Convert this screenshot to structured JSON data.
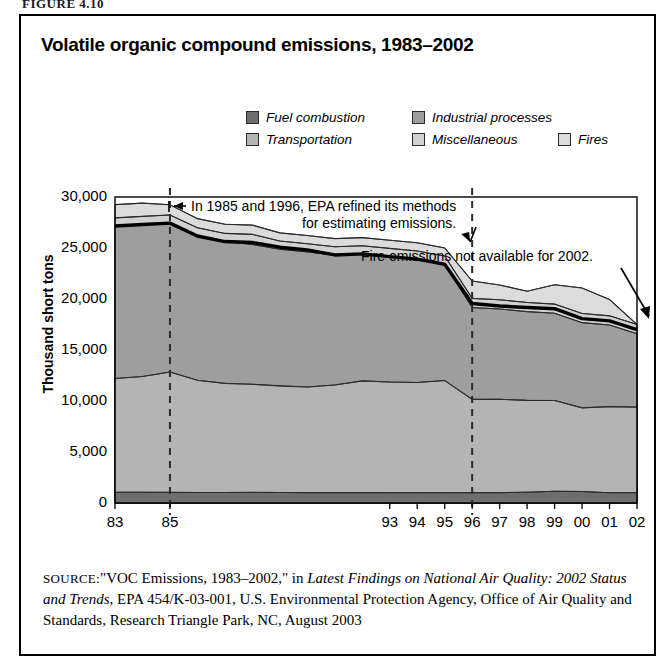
{
  "figure_caption": "FIGURE 4.10",
  "chart_title": "Volatile organic compound emissions, 1983–2002",
  "legend": {
    "items": [
      {
        "label": "Fuel combustion",
        "color": "#6e6e6e",
        "key": "fuel_combustion"
      },
      {
        "label": "Industrial processes",
        "color": "#9e9e9e",
        "key": "industrial_processes"
      },
      {
        "label": "Transportation",
        "color": "#b4b4b4",
        "key": "transportation"
      },
      {
        "label": "Miscellaneous",
        "color": "#d2d2d2",
        "key": "miscellaneous"
      },
      {
        "label": "Fires",
        "color": "#dcdcdc",
        "key": "fires"
      }
    ]
  },
  "annotations": [
    {
      "name": "epa-methods-note",
      "line1": "In 1985 and 1996, EPA refined its methods",
      "line2": "for estimating emissions."
    },
    {
      "name": "fires-2002-note",
      "text": "Fire emissions not available for 2002."
    }
  ],
  "source": {
    "label": "SOURCE:",
    "text_1": "\"VOC Emissions, 1983–2002,\" in ",
    "italic_1": "Latest Findings on National Air Quality: 2002 Status and Trends,",
    "text_2": " EPA 454/K-03-001, U.S. Environmental Protection Agency, Office of Air Quality and Standards, Research Triangle Park, NC, August 2003"
  },
  "chart_data": {
    "type": "area",
    "title": "Volatile organic compound emissions, 1983–2002",
    "xlabel": "",
    "ylabel": "Thousand short tons",
    "ylim": [
      0,
      30000
    ],
    "yticks": [
      0,
      5000,
      10000,
      15000,
      20000,
      25000,
      30000
    ],
    "ytick_labels": [
      "0",
      "5,000",
      "10,000",
      "15,000",
      "20,000",
      "25,000",
      "30,000"
    ],
    "grid": false,
    "legend_position": "top",
    "stacked": true,
    "stack_order": [
      "fuel_combustion",
      "transportation",
      "industrial_processes",
      "miscellaneous",
      "fires"
    ],
    "x": [
      1983,
      1984,
      1985,
      1986,
      1987,
      1988,
      1989,
      1990,
      1991,
      1992,
      1993,
      1994,
      1995,
      1996,
      1997,
      1998,
      1999,
      2000,
      2001,
      2002
    ],
    "xtick_labels": [
      "83",
      "",
      "85",
      "",
      "",
      "",
      "",
      "",
      "",
      "",
      "93",
      "94",
      "95",
      "96",
      "97",
      "98",
      "99",
      "00",
      "01",
      "02"
    ],
    "vertical_markers": [
      {
        "year": 1985,
        "style": "dashed"
      },
      {
        "year": 1996,
        "style": "dashed"
      }
    ],
    "series": [
      {
        "name": "Fuel combustion",
        "color": "#6e6e6e",
        "values": [
          1050,
          1050,
          1040,
          1030,
          1030,
          1040,
          1030,
          1020,
          1020,
          1020,
          1010,
          1010,
          1010,
          1010,
          1020,
          1060,
          1150,
          1130,
          1000,
          1000
        ]
      },
      {
        "name": "Transportation",
        "color": "#b4b4b4",
        "values": [
          11150,
          11350,
          11800,
          11000,
          10700,
          10600,
          10450,
          10350,
          10550,
          10950,
          10850,
          10800,
          11000,
          9150,
          9150,
          9000,
          8900,
          8200,
          8450,
          8400
        ]
      },
      {
        "name": "Industrial processes",
        "color": "#9e9e9e",
        "values": [
          14950,
          14900,
          14600,
          14150,
          13900,
          13700,
          13400,
          13250,
          12750,
          12450,
          12300,
          12100,
          11400,
          9000,
          8850,
          8700,
          8550,
          8350,
          8000,
          7200
        ]
      },
      {
        "name": "Miscellaneous",
        "color": "#d2d2d2",
        "values": [
          800,
          800,
          800,
          800,
          800,
          1000,
          800,
          800,
          800,
          800,
          800,
          800,
          800,
          900,
          900,
          900,
          900,
          900,
          900,
          900
        ]
      },
      {
        "name": "Fires",
        "color": "#dcdcdc",
        "values": [
          1300,
          1300,
          1000,
          900,
          900,
          900,
          800,
          800,
          800,
          800,
          800,
          800,
          800,
          1700,
          1450,
          1100,
          1900,
          2500,
          1600,
          0
        ]
      }
    ],
    "total_line": {
      "name": "Total excluding fires",
      "style": "thick-black",
      "values": [
        27150,
        27300,
        27440,
        26180,
        25630,
        25540,
        25080,
        24820,
        24320,
        24420,
        24160,
        23910,
        23410,
        19560,
        19320,
        19160,
        19050,
        18080,
        17850,
        17000
      ]
    }
  }
}
